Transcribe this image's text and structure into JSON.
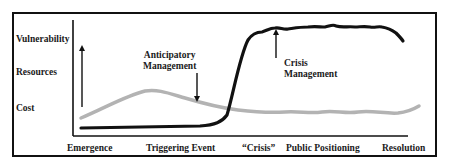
{
  "diagram": {
    "y_labels": [
      "Vulnerability",
      "Resources",
      "Cost"
    ],
    "x_labels": [
      "Emergence",
      "Triggering Event",
      "“Crisis”",
      "Public Positioning",
      "Resolution"
    ],
    "annotations": {
      "anticipatory": [
        "Anticipatory",
        "Management"
      ],
      "crisis": [
        "Crisis",
        "Management"
      ]
    },
    "series": [
      {
        "name": "crisis-management-curve",
        "color": "#111111",
        "description": "low and flat until triggering event, sharp rise at crisis, high plateau, slight decline near resolution"
      },
      {
        "name": "anticipatory-management-curve",
        "color": "#b3b3b3",
        "description": "rises from emergence to peak before triggering event, declines to crossover at crisis, stays low through resolution"
      }
    ],
    "icons": {
      "y_axis_arrow": "arrow-up-icon",
      "anticipatory_arrow": "arrow-down-icon",
      "crisis_arrow": "arrow-up-icon"
    }
  }
}
